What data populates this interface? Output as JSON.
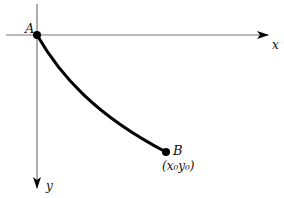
{
  "diagram": {
    "axes": {
      "x_label": "x",
      "y_label": "y"
    },
    "points": {
      "A": {
        "label": "A"
      },
      "B": {
        "label": "B",
        "coords_label": "(x₀y₀)"
      }
    },
    "colors": {
      "axis": "#777777",
      "curve": "#000000",
      "text": "#111111"
    }
  }
}
